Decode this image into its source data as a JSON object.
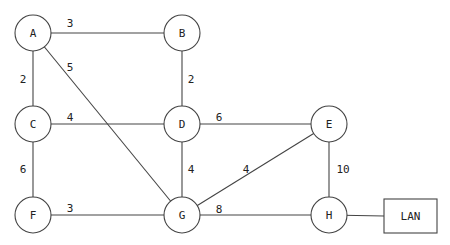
{
  "diagram": {
    "type": "weighted-network-graph",
    "colors": {
      "line": "#444444",
      "text": "#222222",
      "background": "#ffffff"
    },
    "nodes": [
      {
        "id": "A",
        "label": "A",
        "x": 33,
        "y": 33,
        "r": 18
      },
      {
        "id": "B",
        "label": "B",
        "x": 182,
        "y": 33,
        "r": 18
      },
      {
        "id": "C",
        "label": "C",
        "x": 33,
        "y": 124,
        "r": 18
      },
      {
        "id": "D",
        "label": "D",
        "x": 182,
        "y": 124,
        "r": 18
      },
      {
        "id": "E",
        "label": "E",
        "x": 329,
        "y": 124,
        "r": 18
      },
      {
        "id": "F",
        "label": "F",
        "x": 33,
        "y": 215,
        "r": 18
      },
      {
        "id": "G",
        "label": "G",
        "x": 182,
        "y": 215,
        "r": 18
      },
      {
        "id": "H",
        "label": "H",
        "x": 329,
        "y": 215,
        "r": 18
      }
    ],
    "lan": {
      "label": "LAN",
      "x": 384,
      "y": 199,
      "w": 53,
      "h": 34,
      "connected_to": "H"
    },
    "edges": [
      {
        "from": "A",
        "to": "B",
        "weight": "3",
        "lx": 70,
        "ly": 23
      },
      {
        "from": "A",
        "to": "C",
        "weight": "2",
        "lx": 23,
        "ly": 79
      },
      {
        "from": "A",
        "to": "G",
        "weight": "5",
        "lx": 70,
        "ly": 67
      },
      {
        "from": "B",
        "to": "D",
        "weight": "2",
        "lx": 191,
        "ly": 79
      },
      {
        "from": "C",
        "to": "D",
        "weight": "4",
        "lx": 70,
        "ly": 117
      },
      {
        "from": "D",
        "to": "E",
        "weight": "6",
        "lx": 219,
        "ly": 117
      },
      {
        "from": "C",
        "to": "F",
        "weight": "6",
        "lx": 23,
        "ly": 169
      },
      {
        "from": "D",
        "to": "G",
        "weight": "4",
        "lx": 191,
        "ly": 169
      },
      {
        "from": "E",
        "to": "G",
        "weight": "4",
        "lx": 246,
        "ly": 169
      },
      {
        "from": "E",
        "to": "H",
        "weight": "10",
        "lx": 343,
        "ly": 169
      },
      {
        "from": "F",
        "to": "G",
        "weight": "3",
        "lx": 70,
        "ly": 208
      },
      {
        "from": "G",
        "to": "H",
        "weight": "8",
        "lx": 219,
        "ly": 209
      }
    ]
  }
}
